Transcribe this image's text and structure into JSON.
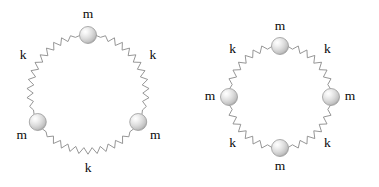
{
  "figure": {
    "background_color": "#ffffff",
    "canvas": {
      "width": 379,
      "height": 187
    },
    "spring": {
      "stroke_color": "#8a8a8a",
      "stroke_width": 0.9,
      "zigzag_amplitude": 3.2
    },
    "mass": {
      "fill_light": "#f2f2f2",
      "fill_mid": "#d8d8d8",
      "fill_dark": "#b4b4b4",
      "stroke_color": "#9a9a9a",
      "radius": 8.5
    },
    "label_color": "#0a0a0a",
    "label_font_size": 13.5,
    "diagrams": [
      {
        "name": "three-mass-ring",
        "center": {
          "x": 88,
          "y": 93
        },
        "radius": 58,
        "mass_count": 3,
        "masses": [
          {
            "label": "m",
            "angle_deg": 90,
            "label_dx": 0,
            "label_dy": -20
          },
          {
            "label": "m",
            "angle_deg": 210,
            "label_dx": -16,
            "label_dy": 14
          },
          {
            "label": "m",
            "angle_deg": 330,
            "label_dx": 17,
            "label_dy": 14
          }
        ],
        "springs": [
          {
            "label": "k",
            "angle_deg": 150,
            "label_radius_offset": 17
          },
          {
            "label": "k",
            "angle_deg": 30,
            "label_radius_offset": 17
          },
          {
            "label": "k",
            "angle_deg": 270,
            "label_radius_offset": 18
          }
        ]
      },
      {
        "name": "four-mass-ring",
        "center": {
          "x": 280,
          "y": 97
        },
        "radius": 51,
        "mass_count": 4,
        "masses": [
          {
            "label": "m",
            "angle_deg": 90,
            "label_dx": 0,
            "label_dy": -19
          },
          {
            "label": "m",
            "angle_deg": 180,
            "label_dx": -19,
            "label_dy": 0
          },
          {
            "label": "m",
            "angle_deg": 270,
            "label_dx": 0,
            "label_dy": 19
          },
          {
            "label": "m",
            "angle_deg": 0,
            "label_dx": 19,
            "label_dy": 0
          }
        ],
        "springs": [
          {
            "label": "k",
            "angle_deg": 135,
            "label_radius_offset": 16
          },
          {
            "label": "k",
            "angle_deg": 45,
            "label_radius_offset": 16
          },
          {
            "label": "k",
            "angle_deg": 225,
            "label_radius_offset": 16
          },
          {
            "label": "k",
            "angle_deg": 315,
            "label_radius_offset": 16
          }
        ]
      }
    ]
  }
}
